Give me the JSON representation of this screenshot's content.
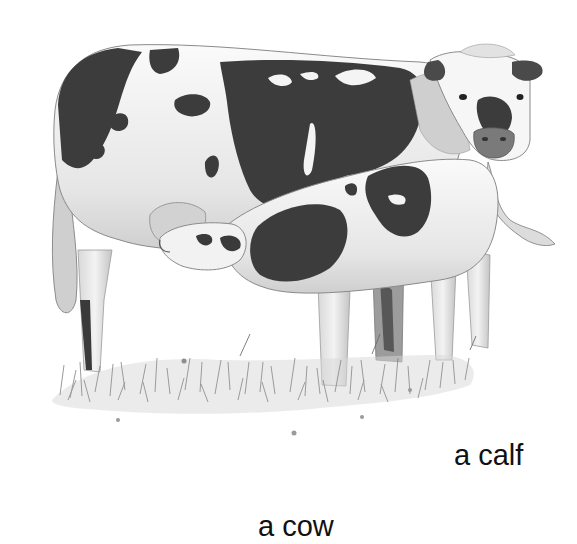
{
  "illustration": {
    "subject": "cow nursing calf in grass",
    "style": "grayscale pencil drawing",
    "colors": {
      "background": "#ffffff",
      "spot": "#3a3a3a",
      "body": "#f4f4f4",
      "shade": "#c8c8c8",
      "grass": "#8a8a8a",
      "text": "#111111"
    }
  },
  "labels": {
    "calf": "a calf",
    "cow": "a cow"
  }
}
